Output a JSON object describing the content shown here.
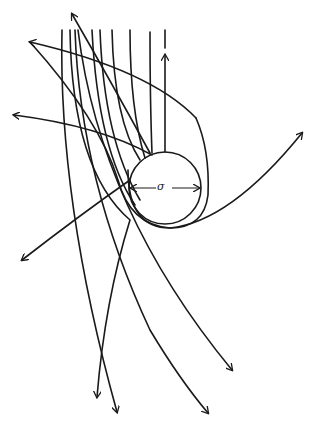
{
  "diagram": {
    "sphere_label": "σ",
    "colors": {
      "line": "#1a1a1a",
      "background": "#ffffff"
    }
  }
}
